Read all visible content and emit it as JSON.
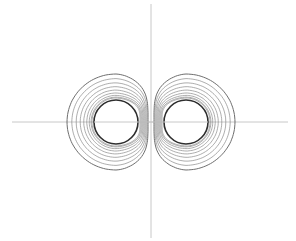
{
  "chart_data": {
    "type": "contour",
    "title": "",
    "xlabel": "",
    "ylabel": "",
    "grid": false,
    "legend": null,
    "axes": {
      "origin_px": [
        151,
        122
      ],
      "x_axis_px": [
        12,
        288
      ],
      "y_axis_px": [
        4,
        238
      ],
      "tick_labels": []
    },
    "centers": [
      {
        "name": "left",
        "x_px": 116,
        "y_px": 122,
        "core_radius_px": 22
      },
      {
        "name": "right",
        "x_px": 186,
        "y_px": 122,
        "core_radius_px": 22
      }
    ],
    "contours_per_side": 9,
    "outer_contour_extent_px": {
      "left": {
        "x_min": 67,
        "x_max": 148,
        "y_min": 74,
        "y_max": 170
      },
      "right": {
        "x_min": 154,
        "x_max": 235,
        "y_min": 74,
        "y_max": 170
      }
    }
  },
  "colors": {
    "axis": "#c8c8c8",
    "contour": "#8a8a8a",
    "outer_contour": "#6e6e6e",
    "core": "#2e2e2e",
    "background": "#ffffff"
  }
}
